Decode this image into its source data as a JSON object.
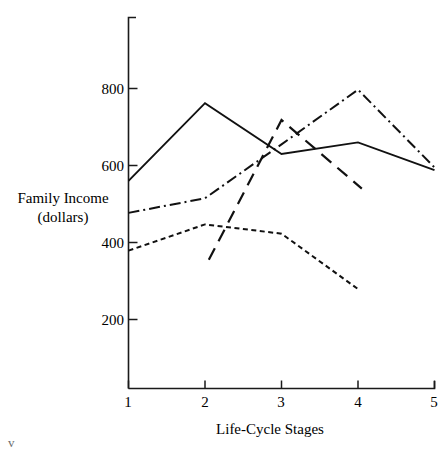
{
  "chart_data": {
    "type": "line",
    "title": "",
    "xlabel": "Life-Cycle Stages",
    "ylabel": "Family Income (dollars)",
    "ylabel_lines": [
      "Family Income",
      "(dollars)"
    ],
    "x": [
      1,
      2,
      3,
      4,
      5
    ],
    "xticklabels": [
      "1",
      "2",
      "3",
      "4",
      "5"
    ],
    "yticks": [
      200,
      400,
      600,
      800
    ],
    "yticklabels": [
      "200",
      "400",
      "600",
      "800"
    ],
    "xlim": [
      1,
      5
    ],
    "ylim": [
      0,
      900
    ],
    "grid": false,
    "legend": "none",
    "series": [
      {
        "name": "solid-series",
        "style": "solid",
        "x": [
          1,
          2,
          3,
          4,
          5
        ],
        "values": [
          560,
          762,
          630,
          660,
          588
        ]
      },
      {
        "name": "dash-dot-series",
        "style": "dash-dot",
        "x": [
          1,
          2,
          3,
          4,
          5
        ],
        "values": [
          477,
          515,
          655,
          797,
          595
        ]
      },
      {
        "name": "short-dash-series",
        "style": "short-dash",
        "x": [
          1,
          2,
          3,
          4
        ],
        "values": [
          379,
          447,
          423,
          279
        ]
      },
      {
        "name": "long-dash-series",
        "style": "long-dash",
        "x": [
          2.05,
          3,
          4.05
        ],
        "values": [
          355,
          718,
          540
        ]
      }
    ]
  },
  "corner": {
    "fragment": "v"
  }
}
